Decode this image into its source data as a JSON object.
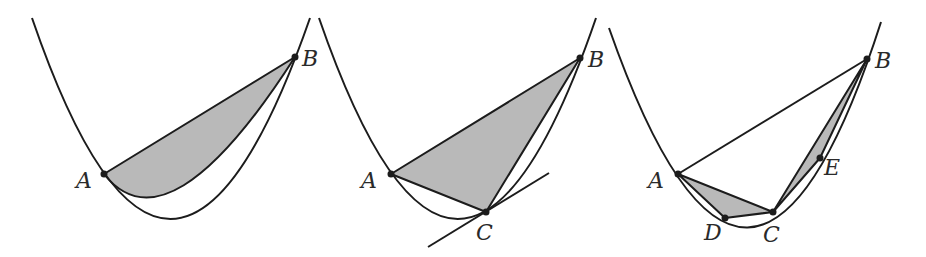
{
  "figure": {
    "panels": [
      {
        "id": "panel-1",
        "description": "Parabolic segment bounded by chord AB",
        "points": {
          "A": "A",
          "B": "B"
        }
      },
      {
        "id": "panel-2",
        "description": "Inscribed triangle ABC with tangent line at C",
        "points": {
          "A": "A",
          "B": "B",
          "C": "C"
        }
      },
      {
        "id": "panel-3",
        "description": "Further inscribed triangles ADC and CEB",
        "points": {
          "A": "A",
          "B": "B",
          "C": "C",
          "D": "D",
          "E": "E"
        }
      }
    ],
    "colors": {
      "stroke": "#1c1c1c",
      "shade": "#b9b9b9",
      "background": "#ffffff"
    }
  }
}
